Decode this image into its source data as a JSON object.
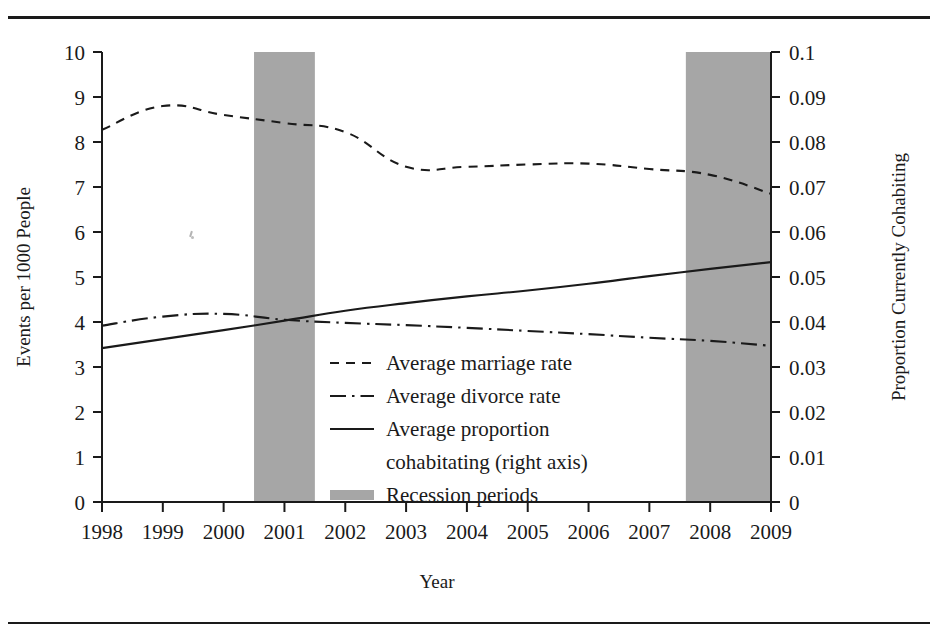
{
  "figure": {
    "background_color": "#ffffff",
    "ink_color": "#1a1a1a",
    "recession_band_color": "#a6a6a6"
  },
  "axes": {
    "left": {
      "title": "Events per 1000 People",
      "ticks": [
        "0",
        "1",
        "2",
        "3",
        "4",
        "5",
        "6",
        "7",
        "8",
        "9",
        "10"
      ],
      "min": 0,
      "max": 10
    },
    "right": {
      "title": "Proportion Currently Cohabiting",
      "ticks": [
        "0",
        "0.01",
        "0.02",
        "0.03",
        "0.04",
        "0.05",
        "0.06",
        "0.07",
        "0.08",
        "0.09",
        "0.1"
      ],
      "min": 0,
      "max": 0.1
    },
    "bottom": {
      "title": "Year",
      "ticks": [
        "1998",
        "1999",
        "2000",
        "2001",
        "2002",
        "2003",
        "2004",
        "2005",
        "2006",
        "2007",
        "2008",
        "2009"
      ]
    }
  },
  "legend": {
    "items": [
      {
        "label": "Average marriage rate",
        "style": "dashed"
      },
      {
        "label": "Average divorce rate",
        "style": "dash-dot"
      },
      {
        "label": "Average proportion",
        "label2": "cohabitating (right axis)",
        "style": "solid"
      },
      {
        "label": "Recession periods",
        "style": "band"
      }
    ]
  },
  "chart_data": {
    "type": "line",
    "title": "",
    "xlabel": "Year",
    "ylabel": "Events per 1000 People",
    "y2label": "Proportion Currently Cohabiting",
    "grid": false,
    "legend_position": "center-right-inside",
    "x": [
      1998,
      1999,
      2000,
      2001,
      2002,
      2003,
      2004,
      2005,
      2006,
      2007,
      2008,
      2009
    ],
    "xlim": [
      1998,
      2009
    ],
    "ylim": [
      0,
      10
    ],
    "y2lim": [
      0,
      0.1
    ],
    "series": [
      {
        "name": "Average marriage rate",
        "axis": "left",
        "style": "dashed",
        "values": [
          8.27,
          8.8,
          8.6,
          8.42,
          8.22,
          7.45,
          7.45,
          7.5,
          7.52,
          7.4,
          7.27,
          6.85
        ]
      },
      {
        "name": "Average divorce rate",
        "axis": "left",
        "style": "dash-dot",
        "values": [
          3.92,
          4.12,
          4.18,
          4.05,
          3.98,
          3.93,
          3.87,
          3.8,
          3.73,
          3.65,
          3.58,
          3.47
        ]
      },
      {
        "name": "Average proportion cohabitating (right axis)",
        "axis": "right",
        "style": "solid",
        "values": [
          0.0342,
          0.0362,
          0.0382,
          0.0403,
          0.0425,
          0.0442,
          0.0457,
          0.047,
          0.0485,
          0.0502,
          0.0518,
          0.0533
        ]
      }
    ],
    "shaded_regions": [
      {
        "name": "Recession periods",
        "x_start": 2000.5,
        "x_end": 2001.5
      },
      {
        "name": "Recession periods",
        "x_start": 2007.6,
        "x_end": 2009.0
      }
    ]
  }
}
